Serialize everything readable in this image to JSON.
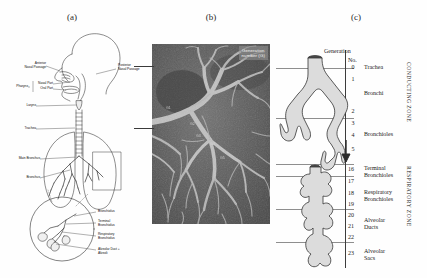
{
  "figure": {
    "panels": [
      {
        "id": "a",
        "letter": "(a)"
      },
      {
        "id": "b",
        "letter": "(b)"
      },
      {
        "id": "c",
        "letter": "(c)"
      }
    ]
  },
  "panel_a": {
    "caption": "(a)",
    "description": "Sagittal diagram of the human respiratory tract with a circular magnified inset of the terminal airway unit",
    "labels": [
      {
        "name": "anterior-nasal-passage",
        "text": "Anterior\nNasal Passage",
        "line1": "Anterior",
        "line2": "Nasal Passage"
      },
      {
        "name": "posterior-nasal-passage",
        "text": "Posterior\nNasal Passage",
        "line1": "Posterior",
        "line2": "Nasal Passage"
      },
      {
        "name": "pharynx",
        "text": "Pharynx",
        "line1": "Pharynx",
        "line2": ""
      },
      {
        "name": "nasal-part",
        "text": "Nasal Part",
        "line1": "Nasal Part",
        "line2": ""
      },
      {
        "name": "oral-part",
        "text": "Oral Part",
        "line1": "Oral Part",
        "line2": ""
      },
      {
        "name": "larynx",
        "text": "Larynx",
        "line1": "Larynx",
        "line2": ""
      },
      {
        "name": "trachea",
        "text": "Trachea",
        "line1": "Trachea",
        "line2": ""
      },
      {
        "name": "main-bronchus",
        "text": "Main Bronchus",
        "line1": "Main Bronchus",
        "line2": ""
      },
      {
        "name": "bronchus",
        "text": "Bronchus",
        "line1": "Bronchus",
        "line2": ""
      }
    ],
    "inset_labels": [
      {
        "name": "bronchiolus",
        "line1": "Bronchiolus",
        "line2": ""
      },
      {
        "name": "terminal-bronchiolus",
        "line1": "Terminal",
        "line2": "Bronchiolus"
      },
      {
        "name": "respiratory-bronchiolus",
        "line1": "Respiratory",
        "line2": "Bronchiolus"
      },
      {
        "name": "alveolar-duct-alveoli",
        "line1": "Alveolar Duct +",
        "line2": "Alveoli"
      }
    ]
  },
  "panel_b": {
    "caption": "(b)",
    "badge_line1": "Generation",
    "badge_line2": "number (G)",
    "description": "Grayscale resin cast micrograph of the bronchial tree",
    "generation_marks": [
      "G1",
      "G2",
      "G3",
      "G4",
      "G5"
    ]
  },
  "panel_c": {
    "caption": "(c)",
    "header_line1": "Generation",
    "header_line2": "No.",
    "rows": [
      {
        "num": "0",
        "label": "Trachea"
      },
      {
        "num": "1",
        "label": ""
      },
      {
        "num": "2",
        "label": "Bronchi"
      },
      {
        "num": "3",
        "label": ""
      },
      {
        "num": "4",
        "label": "Bronchioles"
      },
      {
        "num": "5",
        "label": ""
      },
      {
        "num": "16",
        "label": "Terminal"
      },
      {
        "num": "17",
        "label": "Bronchioles"
      },
      {
        "num": "18",
        "label": "Respiratory"
      },
      {
        "num": "19",
        "label": "Bronchioles"
      },
      {
        "num": "20",
        "label": "Alveolar"
      },
      {
        "num": "21",
        "label": "Ducts"
      },
      {
        "num": "22",
        "label": ""
      },
      {
        "num": "23",
        "label": "Alveolar Sacs"
      }
    ],
    "group_labels": {
      "trachea": "Trachea",
      "bronchi": "Bronchi",
      "bronchioles": "Bronchioles",
      "terminal_bronchioles_l1": "Terminal",
      "terminal_bronchioles_l2": "Bronchioles",
      "respiratory_bronchioles_l1": "Respiratory",
      "respiratory_bronchioles_l2": "Bronchioles",
      "alveolar_ducts_l1": "Alveolar",
      "alveolar_ducts_l2": "Ducts",
      "alveolar_sacs_l1": "Alveolar",
      "alveolar_sacs_l2": "Sacs"
    },
    "zones": {
      "conducting": "CONDUCTING ZONE",
      "respiratory": "RESPIRATORY ZONE"
    }
  },
  "colors": {
    "background": "#ffffff",
    "ink": "#1a1a1a",
    "rule": "#8e8e8e",
    "airway_fill": "#dcdcdc",
    "airway_stroke": "#3a3a3a",
    "micrograph_dark": "#3a3a3a",
    "micrograph_light": "#e8e8e8"
  }
}
